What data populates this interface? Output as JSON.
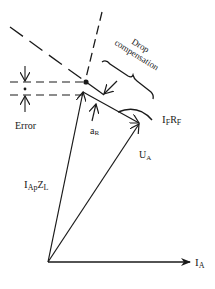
{
  "diagram": {
    "labels": {
      "drop_compensation_line1": "Drop",
      "drop_compensation_line2": "compensation",
      "error": "Error",
      "alpha_r": "a",
      "alpha_r_sub": "R",
      "if_rf_main": "I",
      "if_rf_sub1": "F",
      "if_rf_mid": "R",
      "if_rf_sub2": "F",
      "ua_main": "U",
      "ua_sub": "A",
      "iapzl_main": "I",
      "iapzl_sub1": "Ap",
      "iapzl_mid": "Z",
      "iapzl_sub2": "L",
      "ia_main": "I",
      "ia_sub": "A"
    },
    "colors": {
      "ink": "#1a1a1a",
      "background": "#ffffff"
    },
    "vectors": [
      {
        "name": "I_A",
        "from": [
          48,
          262
        ],
        "to": [
          188,
          262
        ]
      },
      {
        "name": "I_ApZ_L",
        "from": [
          48,
          262
        ],
        "to": [
          83,
          92
        ]
      },
      {
        "name": "U_A",
        "from": [
          48,
          262
        ],
        "to": [
          139,
          124
        ]
      },
      {
        "name": "I_FR_F",
        "from": [
          83,
          92
        ],
        "to": [
          139,
          123
        ]
      }
    ]
  }
}
